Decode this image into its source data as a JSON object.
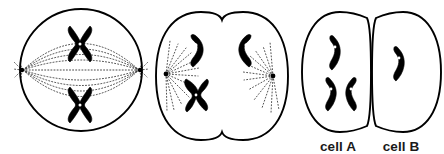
{
  "figure": {
    "background_color": "#ffffff",
    "ink_color": "#000000",
    "panel_count": 3
  },
  "panels": [
    {
      "id": "panel-1",
      "name": "metaphase-cell",
      "shape": "circle",
      "stage_description": "metaphase",
      "center": [
        81,
        70
      ],
      "radius": 61,
      "poles": [
        [
          22,
          70
        ],
        [
          140,
          70
        ]
      ],
      "chromosomes": [
        {
          "type": "X-shaped-replicated",
          "x": 80,
          "y": 40,
          "rotation": 0
        },
        {
          "type": "X-shaped-replicated",
          "x": 80,
          "y": 101,
          "rotation": 0
        }
      ],
      "spindle_fibers": 9,
      "fiber_style": "dotted-arcs"
    },
    {
      "id": "panel-2",
      "name": "anaphase-telophase-cell",
      "shape": "cleaving-dumbbell",
      "stage_description": "anaphase with cleavage furrow",
      "center": [
        222,
        76
      ],
      "poles": [
        [
          166,
          74
        ],
        [
          273,
          76
        ]
      ],
      "chromosomes": [
        {
          "type": "single-chromatid-bent",
          "x": 201,
          "y": 51,
          "rotation": 18
        },
        {
          "type": "single-chromatid-bent",
          "x": 240,
          "y": 50,
          "rotation": -18
        },
        {
          "type": "single-chromatid-bent",
          "x": 196,
          "y": 92,
          "rotation": 40
        }
      ],
      "aster_rays_per_pole": 9,
      "fiber_style": "dotted-rays"
    },
    {
      "id": "panel-3",
      "name": "daughter-cells",
      "shape": "two-separated-halves",
      "stage_description": "two daughter cells after division",
      "daughter_cells": [
        {
          "label": "cell A",
          "side": "left",
          "chromosome_count": 3,
          "chromosomes": [
            {
              "type": "single-chromatid-bent",
              "x": 337,
              "y": 51,
              "rotation": 8
            },
            {
              "type": "single-chromatid-bent",
              "x": 331,
              "y": 93,
              "rotation": 0
            },
            {
              "type": "single-chromatid-bent",
              "x": 347,
              "y": 92,
              "rotation": -6
            }
          ]
        },
        {
          "label": "cell B",
          "side": "right",
          "chromosome_count": 1,
          "chromosomes": [
            {
              "type": "single-chromatid-bent",
              "x": 397,
              "y": 63,
              "rotation": 4
            }
          ]
        }
      ]
    }
  ],
  "labels": {
    "cell_a": "cell A",
    "cell_b": "cell B",
    "cell_a_position": [
      338,
      147
    ],
    "cell_b_position": [
      400,
      147
    ]
  }
}
